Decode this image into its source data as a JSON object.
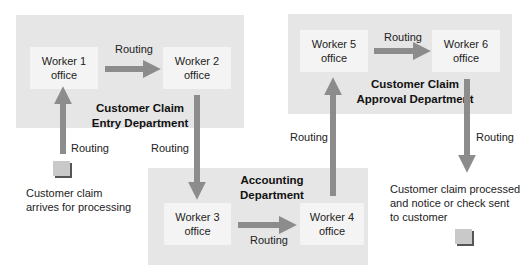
{
  "departments": {
    "entry": {
      "label_line1": "Customer Claim",
      "label_line2": "Entry Department"
    },
    "approval": {
      "label_line1": "Customer Claim",
      "label_line2": "Approval Department"
    },
    "accounting": {
      "label_line1": "Accounting",
      "label_line2": "Department"
    }
  },
  "offices": {
    "w1": {
      "line1": "Worker 1",
      "line2": "office"
    },
    "w2": {
      "line1": "Worker 2",
      "line2": "office"
    },
    "w3": {
      "line1": "Worker 3",
      "line2": "office"
    },
    "w4": {
      "line1": "Worker 4",
      "line2": "office"
    },
    "w5": {
      "line1": "Worker 5",
      "line2": "office"
    },
    "w6": {
      "line1": "Worker 6",
      "line2": "office"
    }
  },
  "routing_labels": {
    "w1_to_w2": "Routing",
    "claim_to_w1": "Routing",
    "w2_to_w3": "Routing",
    "w3_to_w4": "Routing",
    "w4_to_w5": "Routing",
    "w5_to_w6": "Routing",
    "w6_to_out": "Routing"
  },
  "notes": {
    "start_line1": "Customer claim",
    "start_line2": "arrives for processing",
    "end_line1": "Customer claim processed",
    "end_line2": "and notice or check sent",
    "end_line3": "to customer"
  },
  "colors": {
    "department_bg": "#e6e6e6",
    "office_bg": "#f4f4f4",
    "arrow": "#8c8c8c"
  }
}
